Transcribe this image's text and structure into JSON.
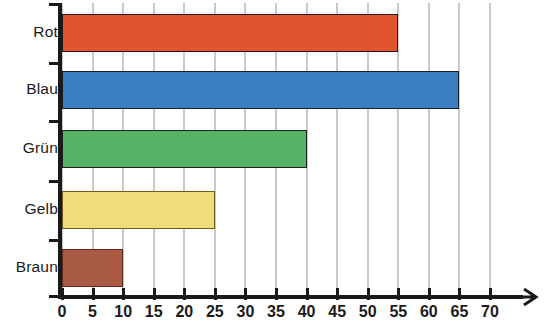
{
  "chart_data": {
    "type": "bar",
    "orientation": "horizontal",
    "title": "",
    "subtitle": "",
    "xlabel": "",
    "ylabel": "",
    "categories": [
      "Rot",
      "Blau",
      "Grün",
      "Gelb",
      "Braun"
    ],
    "values": [
      55,
      65,
      40,
      25,
      10
    ],
    "series": [
      {
        "name": "",
        "values": [
          55,
          65,
          40,
          25,
          10
        ]
      }
    ],
    "xlim": [
      0,
      70
    ],
    "xticks": [
      0,
      5,
      10,
      15,
      20,
      25,
      30,
      35,
      40,
      45,
      50,
      55,
      60,
      65,
      70
    ],
    "xticklabels": [
      "0",
      "5",
      "10",
      "15",
      "20",
      "25",
      "30",
      "35",
      "40",
      "45",
      "50",
      "55",
      "60",
      "65",
      "70"
    ],
    "grid": true,
    "grid_axis": "x",
    "legend": false,
    "legend_position": "none",
    "bar_colors": [
      "#E0542F",
      "#3A7EBF",
      "#56B367",
      "#EFDC7A",
      "#A85A42"
    ],
    "bar_border_colors": [
      "#1e1e1e",
      "#1e1e1e",
      "#1e1e1e",
      "#6d5c1f",
      "#5d2a1d"
    ],
    "axis_color": "#1a1a1a",
    "grid_color": "#c9c9c9",
    "bars": [
      {
        "label": "Rot",
        "value": 55,
        "color": "#E0542F",
        "border": "#1e1e1e"
      },
      {
        "label": "Blau",
        "value": 65,
        "color": "#3A7EBF",
        "border": "#1e1e1e"
      },
      {
        "label": "Grün",
        "value": 40,
        "color": "#56B367",
        "border": "#1e1e1e"
      },
      {
        "label": "Gelb",
        "value": 25,
        "color": "#EFDC7A",
        "border": "#6d5c1f"
      },
      {
        "label": "Braun",
        "value": 10,
        "color": "#A85A42",
        "border": "#5d2a1d"
      }
    ]
  }
}
